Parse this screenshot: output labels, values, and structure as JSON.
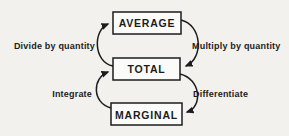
{
  "diagram": {
    "nodes": [
      {
        "id": "average",
        "label": "AVERAGE"
      },
      {
        "id": "total",
        "label": "TOTAL"
      },
      {
        "id": "marginal",
        "label": "MARGINAL"
      }
    ],
    "edges": [
      {
        "id": "divide",
        "label": "Divide by quantity",
        "from": "total",
        "to": "average",
        "side": "left"
      },
      {
        "id": "multiply",
        "label": "Multiply by quantity",
        "from": "average",
        "to": "total",
        "side": "right"
      },
      {
        "id": "integrate",
        "label": "Integrate",
        "from": "marginal",
        "to": "total",
        "side": "left"
      },
      {
        "id": "differentiate",
        "label": "Differentiate",
        "from": "total",
        "to": "marginal",
        "side": "right"
      }
    ],
    "colors": {
      "background": "#f2f1ee",
      "line": "#1c1c1c",
      "box_fill": "#fbfbfa",
      "text": "#1c1c1c"
    }
  }
}
